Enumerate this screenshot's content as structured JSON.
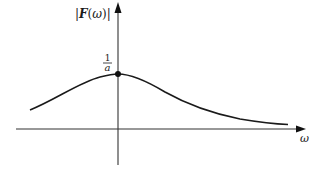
{
  "diagram": {
    "type": "function-plot",
    "y_axis": {
      "label_bar_left": "|",
      "label_func": "F",
      "label_paren_open": "(",
      "label_var": "ω",
      "label_paren_close": ")",
      "label_bar_right": "|"
    },
    "x_axis": {
      "label": "ω"
    },
    "peak": {
      "label_numerator": "1",
      "label_denominator": "a"
    },
    "curve": {
      "description": "Asymmetric bell-shaped magnitude curve peaking at ω = 0",
      "peak_value": "1/a"
    },
    "colors": {
      "stroke": "#1a1a1a",
      "axis": "#333333",
      "background": "#ffffff"
    }
  }
}
